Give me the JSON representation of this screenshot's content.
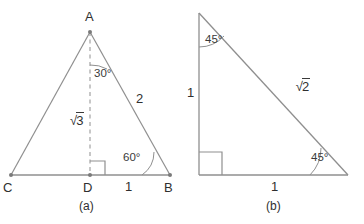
{
  "figure": {
    "stroke_color": "#8f8f8f",
    "text_color": "#2f2f2f",
    "background": "#ffffff",
    "diagrams": [
      {
        "id": "a",
        "caption": "(a)",
        "type": "30-60-90-triangle",
        "vertices": [
          {
            "name": "A",
            "label": "A",
            "x": 90,
            "y": 32
          },
          {
            "name": "C",
            "label": "C",
            "x": 11,
            "y": 175
          },
          {
            "name": "D",
            "label": "D",
            "x": 90,
            "y": 175
          },
          {
            "name": "B",
            "label": "B",
            "x": 170,
            "y": 175
          }
        ],
        "vertex_labels": [
          {
            "key": "A",
            "text": "A",
            "x": 85,
            "y": 10
          },
          {
            "key": "C",
            "text": "C",
            "x": 5,
            "y": 181
          },
          {
            "key": "D",
            "text": "D",
            "x": 84,
            "y": 181
          },
          {
            "key": "B",
            "text": "B",
            "x": 164,
            "y": 181
          }
        ],
        "side_labels": [
          {
            "key": "altitude",
            "sign": "√",
            "num": "3",
            "x": 70,
            "y": 110
          },
          {
            "key": "hypotenuse",
            "text": "2",
            "x": 136,
            "y": 92
          },
          {
            "key": "base-db",
            "text": "1",
            "x": 125,
            "y": 179
          }
        ],
        "angle_labels": [
          {
            "key": "angle-a",
            "text": "30°",
            "x": 94,
            "y": 66
          },
          {
            "key": "angle-b",
            "text": "60°",
            "x": 123,
            "y": 150
          }
        ],
        "right_angle_at": "D",
        "dashed_altitude": true
      },
      {
        "id": "b",
        "caption": "(b)",
        "type": "45-45-90-triangle",
        "vertices": [
          {
            "name": "top",
            "x": 199,
            "y": 13
          },
          {
            "name": "bottom-left",
            "x": 199,
            "y": 175
          },
          {
            "name": "bottom-right",
            "x": 348,
            "y": 175
          }
        ],
        "side_labels": [
          {
            "key": "leg-vertical",
            "text": "1",
            "x": 187,
            "y": 86
          },
          {
            "key": "leg-horizontal",
            "text": "1",
            "x": 270,
            "y": 179
          },
          {
            "key": "hypotenuse",
            "sign": "√",
            "num": "2",
            "x": 277,
            "y": 76
          }
        ],
        "angle_labels": [
          {
            "key": "angle-top",
            "text": "45°",
            "x": 205,
            "y": 32
          },
          {
            "key": "angle-bottom-right",
            "text": "45°",
            "x": 311,
            "y": 150
          }
        ],
        "right_angle_at": "bottom-left"
      }
    ],
    "captions": [
      {
        "key": "caption-a",
        "text": "(a)",
        "x": 79,
        "y": 199
      },
      {
        "key": "caption-b",
        "text": "(b)",
        "x": 266,
        "y": 199
      }
    ]
  }
}
